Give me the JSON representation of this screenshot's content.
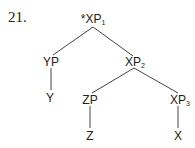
{
  "example_number": "21.",
  "tree": {
    "root": {
      "star": "*",
      "label": "XP",
      "sub": "1"
    },
    "yp": {
      "label": "YP",
      "sub": ""
    },
    "y": {
      "label": "Y"
    },
    "xp2": {
      "label": "XP",
      "sub": "2"
    },
    "zp": {
      "label": "ZP",
      "sub": ""
    },
    "z": {
      "label": "Z"
    },
    "xp3": {
      "label": "XP",
      "sub": "3"
    },
    "x": {
      "label": "X"
    }
  },
  "colors": {
    "ink": "#222222",
    "line": "#444444",
    "background": "#ffffff"
  }
}
